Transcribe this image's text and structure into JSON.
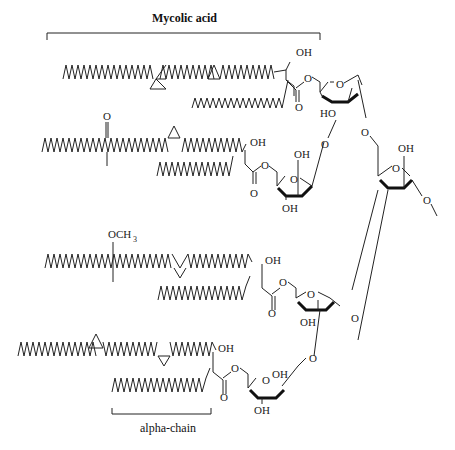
{
  "diagram": {
    "title": "Mycolic acid",
    "alpha_label": "alpha-chain",
    "atoms": {
      "oh": "OH",
      "ho": "HO",
      "o": "O",
      "och3": "OCH",
      "och3_sub": "3"
    },
    "mycolates": [
      {
        "type": "alpha (dicyclopropyl)",
        "chain_feature": "cyclopropane x2"
      },
      {
        "type": "keto",
        "chain_feature": "ketone + methyl, cyclopropane"
      },
      {
        "type": "methoxy",
        "chain_feature": "methoxy + methyl, cyclopropane"
      },
      {
        "type": "alpha (dicyclopropyl)",
        "chain_feature": "cyclopropane x2"
      }
    ]
  }
}
